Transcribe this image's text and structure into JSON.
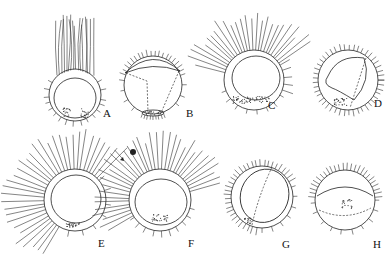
{
  "figure": {
    "specimens": [
      {
        "label": "A",
        "cx": 75,
        "cy": 95,
        "r": 26,
        "hairs": "long-top",
        "inner": "circle",
        "dots": "bottom-cluster"
      },
      {
        "label": "B",
        "cx": 153,
        "cy": 85,
        "r": 29,
        "hairs": "short-all",
        "inner": "dashed-lines",
        "dots": "bottom-band"
      },
      {
        "label": "C",
        "cx": 254,
        "cy": 80,
        "r": 30,
        "hairs": "long-upleft",
        "inner": "circle",
        "dots": "bottom-band"
      },
      {
        "label": "D",
        "cx": 348,
        "cy": 80,
        "r": 30,
        "hairs": "short-all",
        "inner": "irregular-dashed",
        "dots": "bottom-left"
      },
      {
        "label": "E",
        "cx": 75,
        "cy": 200,
        "r": 31,
        "hairs": "long-left-top",
        "inner": "circle",
        "dots": "bottom-cluster"
      },
      {
        "label": "F",
        "cx": 160,
        "cy": 200,
        "r": 31,
        "hairs": "long-all-top",
        "inner": "circle",
        "dots": "bottom-cluster"
      },
      {
        "label": "G",
        "cx": 262,
        "cy": 197,
        "r": 31,
        "hairs": "short-all",
        "inner": "ellipse-dashed",
        "dots": "bottom-left"
      },
      {
        "label": "H",
        "cx": 345,
        "cy": 200,
        "r": 30,
        "hairs": "short-all",
        "inner": "dashed-arc",
        "dots": "center-cluster"
      }
    ],
    "labels": [
      {
        "text": "A",
        "x": 103,
        "y": 117
      },
      {
        "text": "B",
        "x": 186,
        "y": 117
      },
      {
        "text": "C",
        "x": 268,
        "y": 109
      },
      {
        "text": "D",
        "x": 374,
        "y": 107
      },
      {
        "text": "E",
        "x": 98,
        "y": 247
      },
      {
        "text": "F",
        "x": 188,
        "y": 247
      },
      {
        "text": "G",
        "x": 282,
        "y": 248
      },
      {
        "text": "H",
        "x": 373,
        "y": 248
      }
    ]
  }
}
